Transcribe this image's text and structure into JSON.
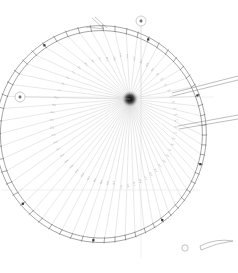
{
  "drawing": {
    "title": "Radial Lofting Plan",
    "type": "technical-cad-lineart",
    "background_color": "#ffffff",
    "line_color": "#5a5a5a",
    "faint_line_color": "#c9c9c9",
    "text_color": "#8a8a8a",
    "hub": {
      "label": "",
      "x": 130,
      "y": 99,
      "radius": 4.5
    },
    "outline": {
      "name": "ovoid-perimeter",
      "description": "egg-shaped closed curve, segmented into panels",
      "segments": 58
    },
    "radial_lines": {
      "count": 58,
      "origin": "hub"
    },
    "callouts": [
      {
        "name": "detail-bubble-top",
        "label": "2",
        "cx": 141,
        "cy": 21,
        "r": 5,
        "leader_to_y": 99
      },
      {
        "name": "detail-bubble-left",
        "label": "1",
        "cx": 20,
        "cy": 97,
        "r": 5,
        "leader_to_x": 130
      }
    ],
    "axes": [
      {
        "name": "vertical-axis",
        "orientation": "vertical",
        "position": 141
      },
      {
        "name": "horizontal-axis",
        "orientation": "horizontal",
        "position": 97
      },
      {
        "name": "lower-horizontal-axis",
        "orientation": "horizontal",
        "position": 190
      }
    ],
    "extension_lines": [
      {
        "name": "extension-line-upper",
        "from_x": 176,
        "from_y": 92,
        "to_x": 238,
        "to_y": 78
      },
      {
        "name": "extension-line-lower",
        "from_x": 182,
        "from_y": 127,
        "to_x": 238,
        "to_y": 118
      }
    ],
    "detached_part": {
      "name": "crescent-sliver",
      "x": 200,
      "y": 240,
      "width": 34,
      "height": 12
    },
    "small_detail_circle": {
      "name": "detail-circle-bottom",
      "cx": 185,
      "cy": 248,
      "r": 3
    },
    "dimension_labels": [
      "12.4",
      "11.8",
      "11.2",
      "10.7",
      "10.3",
      "9.9",
      "9.6",
      "9.3",
      "9.1",
      "8.9",
      "8.8",
      "8.7",
      "8.6",
      "8.6",
      "8.7",
      "8.8",
      "9.0",
      "9.2",
      "9.5",
      "9.8",
      "10.2",
      "10.6",
      "11.1",
      "11.6",
      "12.2",
      "12.8",
      "13.4",
      "14.0",
      "14.6",
      "15.2",
      "15.7",
      "16.1",
      "16.4",
      "16.6",
      "16.7",
      "16.6",
      "16.4",
      "16.0",
      "15.5",
      "14.9",
      "14.2",
      "13.5",
      "12.8",
      "12.1",
      "11.5",
      "10.9",
      "10.4",
      "10.0",
      "9.7",
      "9.4",
      "9.2",
      "9.1",
      "9.1",
      "9.2",
      "9.4",
      "9.7",
      "10.1",
      "10.6",
      "11.2",
      "11.8"
    ],
    "panel_labels": [
      "A1",
      "A2",
      "A3",
      "A4",
      "A5",
      "A6",
      "A7",
      "A8",
      "A9",
      "A10",
      "B1",
      "B2",
      "B3",
      "B4",
      "B5",
      "B6",
      "B7",
      "B8",
      "B9",
      "B10"
    ]
  }
}
